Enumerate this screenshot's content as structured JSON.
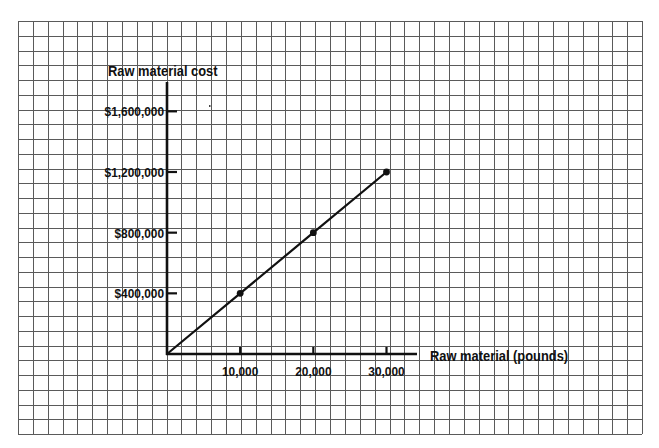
{
  "chart_data": {
    "type": "line",
    "title": "",
    "ylabel": "Raw material cost",
    "xlabel": "Raw material (pounds)",
    "x": [
      0,
      10000,
      20000,
      30000
    ],
    "series": [
      {
        "name": "Raw material cost",
        "values": [
          0,
          400000,
          800000,
          1200000
        ]
      }
    ],
    "markers_at": [
      10000,
      20000,
      30000
    ],
    "x_ticks": [
      10000,
      20000,
      30000
    ],
    "x_tick_labels": [
      "10,000",
      "20,000",
      "30,000"
    ],
    "y_ticks": [
      400000,
      800000,
      1200000,
      1600000
    ],
    "y_tick_labels": [
      "$400,000",
      "$800,000",
      "$1,200,000",
      "$1,600,000"
    ],
    "xlim": [
      0,
      40000
    ],
    "ylim": [
      0,
      1800000
    ],
    "grid": true,
    "legend": "none"
  },
  "colors": {
    "grid": "#5a5a5a",
    "ink": "#111111",
    "background": "#ffffff"
  }
}
